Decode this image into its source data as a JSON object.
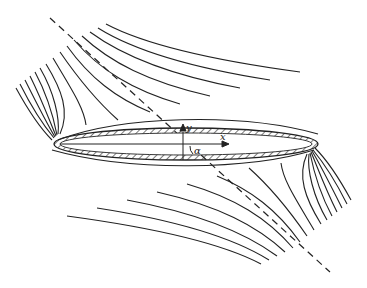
{
  "figure": {
    "labels": {
      "x_axis": "x",
      "y_axis": "y",
      "angle": "α"
    },
    "elements": {
      "body": "hatched ellipse",
      "flow_direction_line": "dashed line",
      "streamlines_top": 15,
      "streamlines_bottom": 15
    },
    "colors": {
      "ink": "#222222",
      "background": "#ffffff"
    }
  }
}
